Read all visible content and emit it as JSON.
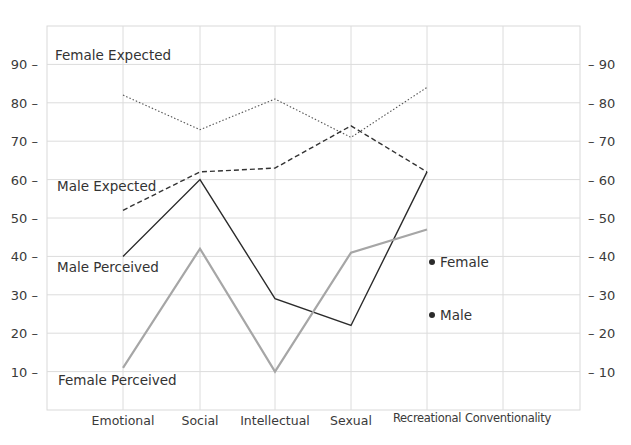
{
  "chart_data": {
    "type": "line",
    "title": "",
    "xlabel": "",
    "ylabel": "",
    "ylim": [
      0,
      100
    ],
    "yticks_left": [
      10,
      20,
      30,
      40,
      50,
      60,
      70,
      80,
      90
    ],
    "yticks_right": [
      10,
      20,
      30,
      40,
      50,
      60,
      70,
      80,
      90
    ],
    "grid": true,
    "categories": [
      "Emotional",
      "Social",
      "Intellectual",
      "Sexual",
      "Recreational",
      "Conventionality"
    ],
    "series": [
      {
        "name": "Female Expected",
        "style": "dotted",
        "color": "#555555",
        "values": [
          82,
          73,
          81,
          71,
          84,
          null
        ]
      },
      {
        "name": "Male Expected",
        "style": "dashed",
        "color": "#333333",
        "values": [
          52,
          62,
          63,
          74,
          62,
          null
        ]
      },
      {
        "name": "Male Perceived",
        "style": "solid",
        "color": "#2b2b2b",
        "values": [
          40,
          60,
          29,
          22,
          62,
          null
        ]
      },
      {
        "name": "Female Perceived",
        "style": "solid-grey",
        "color": "#9a9a9a",
        "values": [
          11,
          42,
          10,
          41,
          47,
          null
        ]
      }
    ],
    "legend": [
      {
        "label": "Female",
        "marker": "dot",
        "x_category": "Recreational",
        "y": 38
      },
      {
        "label": "Male",
        "marker": "dot",
        "x_category": "Recreational",
        "y": 25
      }
    ],
    "annotations": [
      {
        "text": "Female Expected",
        "near_series": "Female Expected"
      },
      {
        "text": "Male Expected",
        "near_series": "Male Expected"
      },
      {
        "text": "Male Perceived",
        "near_series": "Male Perceived"
      },
      {
        "text": "Female Perceived",
        "near_series": "Female Perceived"
      }
    ]
  },
  "labels": {
    "female_expected": "Female Expected",
    "male_expected": "Male Expected",
    "male_perceived": "Male Perceived",
    "female_perceived": "Female Perceived",
    "legend_female": "Female",
    "legend_male": "Male"
  }
}
